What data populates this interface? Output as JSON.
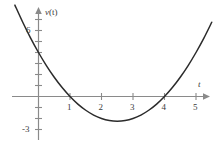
{
  "chart_data": {
    "type": "line",
    "title": "",
    "xlabel": "t",
    "ylabel": "v(t)",
    "xlim": [
      -0.85,
      5.5
    ],
    "ylim": [
      -3.9,
      7.4
    ],
    "grid": false,
    "legend": null,
    "curve": {
      "name": "v(t)",
      "expression": "t^2 - 5t + 4",
      "roots": [
        1,
        4
      ],
      "vertex": {
        "t": 2.5,
        "v": -2.25
      },
      "v_at_zero": 4,
      "x": [
        -0.75,
        -0.5,
        -0.25,
        0,
        0.25,
        0.5,
        0.75,
        1,
        1.25,
        1.5,
        1.75,
        2,
        2.25,
        2.5,
        2.75,
        3,
        3.25,
        3.5,
        3.75,
        4,
        4.25,
        4.5,
        4.75,
        5,
        5.25,
        5.5
      ],
      "y": [
        8.31,
        6.75,
        5.31,
        4,
        2.81,
        1.75,
        0.81,
        0,
        -0.69,
        -1.25,
        -1.69,
        -2,
        -2.19,
        -2.25,
        -2.19,
        -2,
        -1.69,
        -1.25,
        -0.69,
        0,
        0.81,
        1.75,
        2.81,
        4,
        5.31,
        6.75
      ]
    },
    "x_axis": {
      "label": "t",
      "ticks": [
        1,
        2,
        3,
        4,
        5
      ],
      "tick_labels": [
        "1",
        "2",
        "3",
        "4",
        "5"
      ],
      "arrow": true
    },
    "y_axis": {
      "label": "v(t)",
      "labeled_ticks": [
        6,
        -3
      ],
      "labeled_tick_labels": [
        "6",
        "-3"
      ],
      "minor_ticks": [
        7,
        5,
        4,
        3,
        2,
        1,
        -1,
        -2
      ],
      "arrow": true
    },
    "colors": {
      "curve": "#2b2b2b",
      "axis": "#8a8a8a",
      "text": "#3b3b3b",
      "background": "#ffffff"
    }
  },
  "labels": {
    "y_axis_var": "v",
    "y_axis_arg": "(t)",
    "x_axis_var": "t",
    "tick_6": "6",
    "tick_neg3": "-3",
    "tick_1": "1",
    "tick_2": "2",
    "tick_3": "3",
    "tick_4": "4",
    "tick_5": "5"
  }
}
